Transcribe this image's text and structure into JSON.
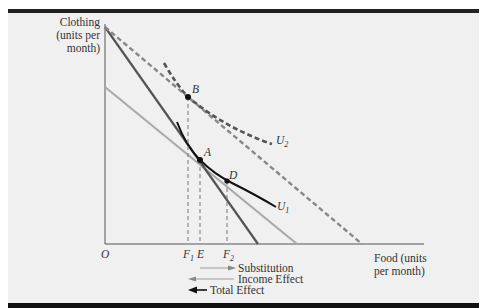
{
  "figure": {
    "axes": {
      "y_label_lines": [
        "Clothing",
        "(units per",
        "month)"
      ],
      "x_label_lines": [
        "Food (units",
        "per month)"
      ],
      "origin_label": "O"
    },
    "points": {
      "A": "A",
      "B": "B",
      "D": "D"
    },
    "curves": {
      "U1": "U",
      "U1_sub": "1",
      "U2": "U",
      "U2_sub": "2"
    },
    "x_ticks": {
      "F1": "F",
      "F1_sub": "1",
      "E": "E",
      "F2": "F",
      "F2_sub": "2"
    },
    "legend": {
      "substitution": "Substitution",
      "income": "Income Effect",
      "total": "Total Effect"
    },
    "colors": {
      "background": "#f0f0f0",
      "dark_line": "#555555",
      "light_line": "#aaaaaa",
      "dashed_line": "#888888",
      "curve": "#111111"
    }
  }
}
